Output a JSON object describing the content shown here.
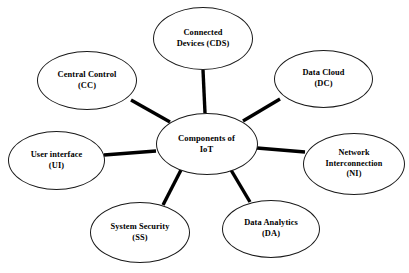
{
  "diagram": {
    "type": "hub-and-spoke",
    "background_color": "#ffffff",
    "node_border_color": "#1a1a1a",
    "edge_color": "#000000",
    "text_color": "#000000",
    "center": {
      "id": "center",
      "name": "components-of-iot",
      "lines": [
        "Components of",
        "IoT"
      ],
      "label": "Components of IoT",
      "cx": 206.5,
      "cy": 144,
      "rx": 51,
      "ry": 31,
      "font_size": 8.6
    },
    "nodes": [
      {
        "id": "cds",
        "name": "connected-devices",
        "lines": [
          "Connected",
          "Devices (CDS)"
        ],
        "label": "Connected Devices (CDS)",
        "abbr": "CDS",
        "cx": 203,
        "cy": 38.5,
        "rx": 50,
        "ry": 31.5,
        "font_size": 8.4
      },
      {
        "id": "dc",
        "name": "data-cloud",
        "lines": [
          "Data Cloud",
          "(DC)"
        ],
        "label": "Data Cloud (DC)",
        "abbr": "DC",
        "cx": 323.5,
        "cy": 79,
        "rx": 49.5,
        "ry": 29,
        "font_size": 8.4
      },
      {
        "id": "ni",
        "name": "network-interconnection",
        "lines": [
          "Network",
          "Interconnection",
          "(NI)"
        ],
        "label": "Network Interconnection (NI)",
        "abbr": "NI",
        "cx": 354,
        "cy": 164,
        "rx": 51,
        "ry": 31,
        "font_size": 8.2
      },
      {
        "id": "da",
        "name": "data-analytics",
        "lines": [
          "Data Analytics",
          "(DA)"
        ],
        "label": "Data Analytics (DA)",
        "abbr": "DA",
        "cx": 271,
        "cy": 229,
        "rx": 49,
        "ry": 29,
        "font_size": 8.4
      },
      {
        "id": "ss",
        "name": "system-security",
        "lines": [
          "System Security",
          "(SS)"
        ],
        "label": "System Security (SS)",
        "abbr": "SS",
        "cx": 140,
        "cy": 232.5,
        "rx": 50,
        "ry": 30.5,
        "font_size": 8.4
      },
      {
        "id": "ui",
        "name": "user-interface",
        "lines": [
          "User interface",
          "(UI)"
        ],
        "label": "User interface (UI)",
        "abbr": "UI",
        "cx": 56.5,
        "cy": 160.5,
        "rx": 48.5,
        "ry": 29.5,
        "font_size": 8.4
      },
      {
        "id": "cc",
        "name": "central-control",
        "lines": [
          "Central Control",
          "(CC)"
        ],
        "label": "Central Control (CC)",
        "abbr": "CC",
        "cx": 87,
        "cy": 80.5,
        "rx": 50,
        "ry": 29.5,
        "font_size": 8.4
      }
    ],
    "edges": [
      {
        "id": "edge-center-cds",
        "name": "edge-center-to-connected-devices",
        "from": "center",
        "to": "cds",
        "x1": 205,
        "y1": 113,
        "x2": 203,
        "y2": 70,
        "width": 3.4
      },
      {
        "id": "edge-center-dc",
        "name": "edge-center-to-data-cloud",
        "from": "center",
        "to": "dc",
        "x1": 243,
        "y1": 121,
        "x2": 280,
        "y2": 99,
        "width": 3.4
      },
      {
        "id": "edge-center-ni",
        "name": "edge-center-to-network-interconnection",
        "from": "center",
        "to": "ni",
        "x1": 257,
        "y1": 148,
        "x2": 305,
        "y2": 152,
        "width": 3.4
      },
      {
        "id": "edge-center-da",
        "name": "edge-center-to-data-analytics",
        "from": "center",
        "to": "da",
        "x1": 231,
        "y1": 170,
        "x2": 250,
        "y2": 202,
        "width": 3.4
      },
      {
        "id": "edge-center-ss",
        "name": "edge-center-to-system-security",
        "from": "center",
        "to": "ss",
        "x1": 181,
        "y1": 170,
        "x2": 163,
        "y2": 205,
        "width": 3.4
      },
      {
        "id": "edge-center-ui",
        "name": "edge-center-to-user-interface",
        "from": "center",
        "to": "ui",
        "x1": 156,
        "y1": 151,
        "x2": 104,
        "y2": 155,
        "width": 3.4
      },
      {
        "id": "edge-center-cc",
        "name": "edge-center-to-central-control",
        "from": "center",
        "to": "cc",
        "x1": 170,
        "y1": 122,
        "x2": 131,
        "y2": 100,
        "width": 3.4
      }
    ]
  }
}
